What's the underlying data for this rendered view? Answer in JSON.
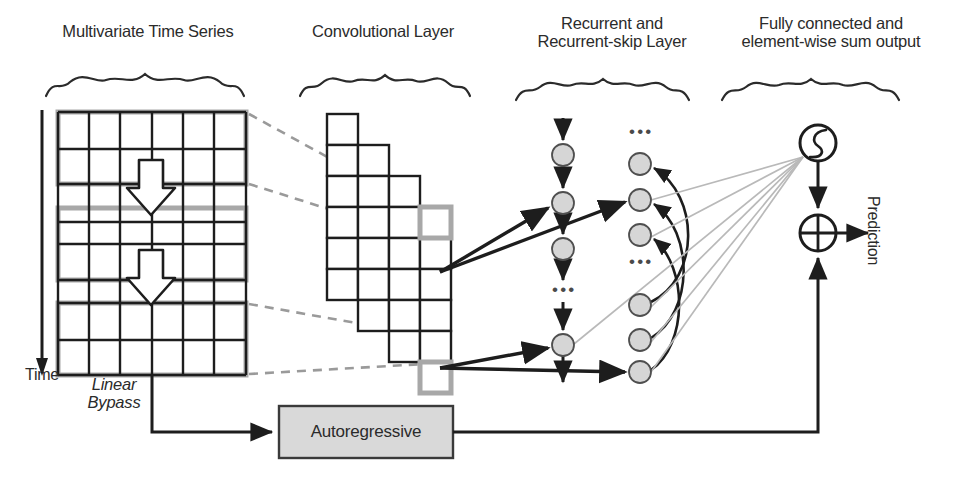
{
  "figure": {
    "background": "#ffffff"
  },
  "colors": {
    "ink": "#2b2b2b",
    "grid_line": "#1d1d1d",
    "highlight_gray": "#a8a8a8",
    "node_fill": "#d6d6d6",
    "node_stroke": "#4f4f4f",
    "dashed_gray": "#9a9a9a",
    "faint_gray": "#b9b9b9",
    "box_fill": "#d9d9d9",
    "box_stroke": "#3a3a3a"
  },
  "sections": [
    {
      "id": "input",
      "label": "Multivariate Time Series",
      "x": 38,
      "y": 22,
      "width": 220,
      "brace_x": 45,
      "brace_y": 76,
      "brace_w": 205
    },
    {
      "id": "conv",
      "label": "Convolutional Layer",
      "x": 288,
      "y": 22,
      "width": 190,
      "brace_x": 300,
      "brace_y": 76,
      "brace_w": 166
    },
    {
      "id": "recurrent",
      "label": "Recurrent and\nRecurrent-skip Layer",
      "x": 512,
      "y": 14,
      "width": 200,
      "brace_x": 515,
      "brace_y": 76,
      "brace_w": 190
    },
    {
      "id": "output",
      "label": "Fully connected and\nelement-wise sum output",
      "x": 718,
      "y": 14,
      "width": 226,
      "brace_x": 722,
      "brace_y": 76,
      "brace_w": 212
    }
  ],
  "axis": {
    "time_label": "Time",
    "time_label_x": 8,
    "time_label_y": 368,
    "arrow_x": 42,
    "arrow_top": 110,
    "arrow_bottom": 370
  },
  "input_grid": {
    "x": 58,
    "y": 112,
    "width": 188,
    "height": 263,
    "columns": 6,
    "rows": 7,
    "border_color": "#a8a8a8",
    "line_color": "#1d1d1d",
    "highlight_bands": [
      {
        "name": "window-1",
        "y": 112,
        "height": 72
      },
      {
        "name": "window-2",
        "y": 208,
        "height": 72
      },
      {
        "name": "window-3",
        "y": 303,
        "height": 72
      }
    ],
    "arrows": [
      {
        "name": "slide-arrow-top",
        "cx": 151,
        "y_top": 162,
        "y_bottom": 215
      },
      {
        "name": "slide-arrow-bottom",
        "cx": 151,
        "y_top": 252,
        "y_bottom": 305
      }
    ]
  },
  "bypass": {
    "label": "Linear\nBypass",
    "x": 86,
    "y": 378
  },
  "conv_layer": {
    "cell_size": 31,
    "origin_x": 327,
    "origin_y": 114,
    "col_dx": 31,
    "col_dy": 31,
    "columns": [
      {
        "index": 0,
        "count": 6
      },
      {
        "index": 1,
        "count": 6
      },
      {
        "index": 2,
        "count": 6
      },
      {
        "index": 3,
        "count": 6
      }
    ],
    "highlighted_cells": [
      {
        "col": 3,
        "row": 1,
        "name": "conv-cell-highlight-top"
      },
      {
        "col": 3,
        "row": 5,
        "name": "conv-cell-highlight-bottom"
      }
    ]
  },
  "dashed_links": [
    {
      "name": "dash-top-upper",
      "x1": 248,
      "y1": 114,
      "x2": 421,
      "y2": 209
    },
    {
      "name": "dash-top-lower",
      "x1": 248,
      "y1": 184,
      "x2": 421,
      "y2": 238
    },
    {
      "name": "dash-bottom-upper",
      "x1": 248,
      "y1": 303,
      "x2": 421,
      "y2": 333
    },
    {
      "name": "dash-bottom-lower",
      "x1": 248,
      "y1": 374,
      "x2": 421,
      "y2": 362
    }
  ],
  "recurrent_layer": {
    "column_x": 563,
    "node_radius": 11,
    "nodes": [
      {
        "name": "recurrent-node-1",
        "cy": 155
      },
      {
        "name": "recurrent-node-2",
        "cy": 203
      },
      {
        "name": "recurrent-node-3",
        "cy": 249
      },
      {
        "name": "recurrent-node-4",
        "cy": 345
      }
    ],
    "ellipsis": [
      {
        "name": "recurrent-ellipsis",
        "x": 552,
        "y": 290
      }
    ],
    "chain_top_y": 118,
    "chain_bottom_y": 382
  },
  "skip_layer": {
    "column_x": 640,
    "node_radius": 11,
    "nodes": [
      {
        "name": "skip-node-1",
        "cy": 164
      },
      {
        "name": "skip-node-2",
        "cy": 200
      },
      {
        "name": "skip-node-3",
        "cy": 235
      },
      {
        "name": "skip-node-4",
        "cy": 305
      },
      {
        "name": "skip-node-5",
        "cy": 340
      },
      {
        "name": "skip-node-6",
        "cy": 372
      }
    ],
    "ellipsis": [
      {
        "name": "skip-ellipsis-top",
        "x": 629,
        "y": 132
      },
      {
        "name": "skip-ellipsis-mid",
        "x": 629,
        "y": 262
      }
    ],
    "skip_curves": [
      {
        "from": "skip-node-4",
        "to": "skip-node-1"
      },
      {
        "from": "skip-node-5",
        "to": "skip-node-2"
      },
      {
        "from": "skip-node-6",
        "to": "skip-node-3"
      }
    ]
  },
  "conv_to_recurrent_arrows": [
    {
      "name": "conv-to-recurrent-top",
      "x1": 440,
      "y1": 272,
      "x2": 551,
      "y2": 207
    },
    {
      "name": "conv-to-skip-top",
      "x1": 440,
      "y1": 272,
      "x2": 628,
      "y2": 201
    },
    {
      "name": "conv-to-recurrent-bottom",
      "x1": 440,
      "y1": 368,
      "x2": 551,
      "y2": 347
    },
    {
      "name": "conv-to-skip-bottom",
      "x1": 440,
      "y1": 368,
      "x2": 628,
      "y2": 372
    }
  ],
  "fully_connected": {
    "fan_origin": {
      "x": 803,
      "y": 156
    },
    "fan_sources": [
      {
        "x": 651,
        "y": 200
      },
      {
        "x": 651,
        "y": 237
      },
      {
        "x": 651,
        "y": 307
      },
      {
        "x": 651,
        "y": 342
      },
      {
        "x": 651,
        "y": 372
      },
      {
        "x": 574,
        "y": 345
      }
    ]
  },
  "output": {
    "activation": {
      "name": "sigmoid-activation-node",
      "cx": 818,
      "cy": 143,
      "r": 18,
      "symbol": "sigmoid-curve"
    },
    "sum": {
      "name": "elementwise-sum-node",
      "cx": 818,
      "cy": 233,
      "r": 18,
      "symbol": "plus-circle"
    },
    "prediction_label": "Prediction",
    "prediction_x": 874,
    "prediction_y": 196
  },
  "autoregressive": {
    "label": "Autoregressive",
    "x": 279,
    "y": 406,
    "width": 174,
    "height": 52,
    "fill": "#d9d9d9",
    "stroke": "#3a3a3a",
    "in_path": {
      "from_x": 152,
      "from_y": 376,
      "elbow_y": 432,
      "to_x": 276
    },
    "out_path": {
      "from_x": 453,
      "y": 432,
      "to_x": 818,
      "up_to_y": 252
    }
  }
}
